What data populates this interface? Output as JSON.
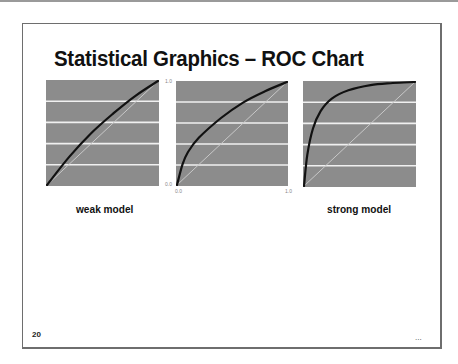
{
  "slide": {
    "title": "Statistical Graphics – ROC Chart",
    "page_number": "20",
    "footer_ellipsis": "..."
  },
  "colors": {
    "plot_background": "#8c8c8c",
    "gridline": "#f0f0f0",
    "roc_curve": "#111111",
    "diagonal": "#c8c8c8"
  },
  "axis": {
    "y_top": "1.0",
    "y_bottom": "0.0",
    "x_left": "0.0",
    "x_right": "1.0"
  },
  "labels": {
    "weak": "weak model",
    "strong": "strong model"
  },
  "chart_data": [
    {
      "type": "line",
      "title": "weak model",
      "xlabel": "",
      "ylabel": "",
      "xlim": [
        0,
        1
      ],
      "ylim": [
        0,
        1
      ],
      "grid": "horizontal",
      "series": [
        {
          "name": "ROC",
          "x": [
            0.0,
            0.2,
            0.4,
            0.6,
            0.8,
            1.0
          ],
          "y": [
            0.0,
            0.27,
            0.5,
            0.69,
            0.86,
            1.0
          ]
        },
        {
          "name": "baseline",
          "x": [
            0.0,
            1.0
          ],
          "y": [
            0.0,
            1.0
          ]
        }
      ]
    },
    {
      "type": "line",
      "title": "",
      "xlabel": "",
      "ylabel": "",
      "xlim": [
        0,
        1
      ],
      "ylim": [
        0,
        1
      ],
      "x_ticks": [
        "0.0",
        "1.0"
      ],
      "y_ticks": [
        "0.0",
        "1.0"
      ],
      "grid": "horizontal",
      "series": [
        {
          "name": "ROC",
          "x": [
            0.0,
            0.05,
            0.1,
            0.2,
            0.4,
            0.6,
            0.8,
            1.0
          ],
          "y": [
            0.0,
            0.2,
            0.32,
            0.46,
            0.65,
            0.8,
            0.91,
            1.0
          ]
        },
        {
          "name": "baseline",
          "x": [
            0.0,
            1.0
          ],
          "y": [
            0.0,
            1.0
          ]
        }
      ]
    },
    {
      "type": "line",
      "title": "strong model",
      "xlabel": "",
      "ylabel": "",
      "xlim": [
        0,
        1
      ],
      "ylim": [
        0,
        1
      ],
      "grid": "horizontal",
      "series": [
        {
          "name": "ROC",
          "x": [
            0.0,
            0.03,
            0.08,
            0.15,
            0.25,
            0.4,
            0.6,
            0.8,
            1.0
          ],
          "y": [
            0.0,
            0.3,
            0.55,
            0.72,
            0.84,
            0.92,
            0.97,
            0.99,
            1.0
          ]
        },
        {
          "name": "baseline",
          "x": [
            0.0,
            1.0
          ],
          "y": [
            0.0,
            1.0
          ]
        }
      ]
    }
  ]
}
